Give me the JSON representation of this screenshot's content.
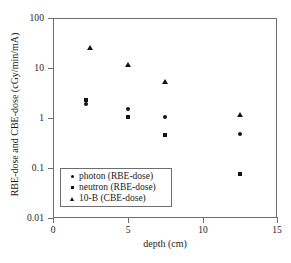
{
  "chart_data": {
    "type": "scatter",
    "title": "",
    "xlabel": "depth (cm)",
    "ylabel": "RBE-dose and CBE-dose (cGy/min/mA)",
    "xlim": [
      0,
      15
    ],
    "ylim": [
      0.01,
      100
    ],
    "yscale": "log",
    "xscale": "linear",
    "grid": false,
    "legend_position": "lower left",
    "xticks": [
      "0",
      "5",
      "10",
      "15"
    ],
    "xtick_values": [
      0,
      5,
      10,
      15
    ],
    "yticks": [
      "100",
      "10",
      "1",
      "0.1",
      "0.01"
    ],
    "ytick_values": [
      100,
      10,
      1,
      0.1,
      0.01
    ],
    "series": [
      {
        "name": "photon (RBE-dose)",
        "marker": "circle",
        "x": [
          2.2,
          5.0,
          7.5,
          12.5
        ],
        "y": [
          1.9,
          1.5,
          1.05,
          0.48
        ]
      },
      {
        "name": "neutron (RBE-dose)",
        "marker": "square",
        "x": [
          2.2,
          5.0,
          7.5,
          12.5
        ],
        "y": [
          2.3,
          1.05,
          0.45,
          0.075
        ]
      },
      {
        "name": "10-B (CBE-dose)",
        "marker": "triangle",
        "x": [
          2.5,
          5.0,
          7.5,
          12.5
        ],
        "y": [
          26.0,
          12.0,
          5.5,
          1.2
        ]
      }
    ]
  },
  "legend": {
    "items": [
      {
        "label": "photon (RBE-dose)"
      },
      {
        "label": "neutron (RBE-dose)"
      },
      {
        "label": "10-B (CBE-dose)"
      }
    ]
  },
  "colors": {
    "marker": "#141414",
    "axis": "#6e6e6e",
    "background": "#ffffff"
  }
}
